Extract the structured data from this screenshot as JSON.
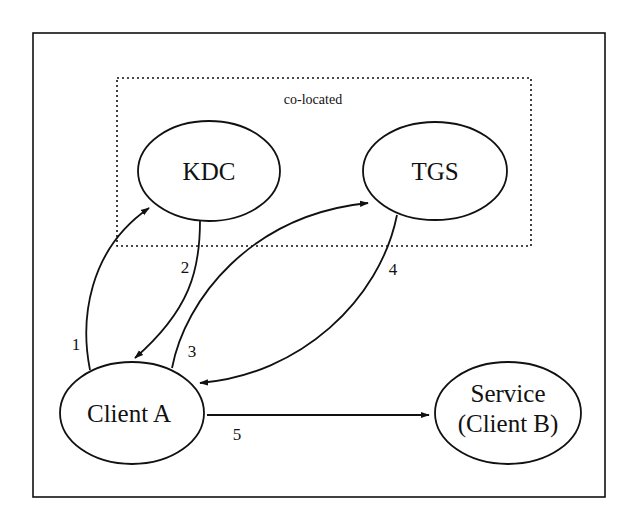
{
  "diagram": {
    "title": "",
    "group": {
      "label": "co-located",
      "style": "dotted"
    },
    "nodes": [
      {
        "id": "kdc",
        "label": "KDC"
      },
      {
        "id": "tgs",
        "label": "TGS"
      },
      {
        "id": "client_a",
        "label": "Client A"
      },
      {
        "id": "service",
        "label_line1": "Service",
        "label_line2": "(Client B)"
      }
    ],
    "edges": [
      {
        "label": "1",
        "from": "Client A",
        "to": "KDC"
      },
      {
        "label": "2",
        "from": "KDC",
        "to": "Client A"
      },
      {
        "label": "3",
        "from": "Client A",
        "to": "TGS"
      },
      {
        "label": "4",
        "from": "TGS",
        "to": "Client A"
      },
      {
        "label": "5",
        "from": "Client A",
        "to": "Service (Client B)"
      }
    ],
    "colors": {
      "stroke": "#111111",
      "background": "#ffffff"
    }
  }
}
